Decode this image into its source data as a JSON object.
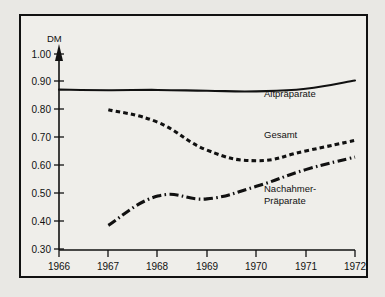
{
  "chart_data": {
    "type": "line",
    "title": "",
    "subtitle": "",
    "xlabel": "",
    "ylabel": "DM",
    "ylabel_position": "top-left-of-axis",
    "grid": false,
    "legend_position": "inline-right-labels",
    "x": [
      1966,
      1967,
      1968,
      1969,
      1970,
      1971,
      1972
    ],
    "xtick_labels": [
      "1966",
      "1967",
      "1968",
      "1969",
      "1970",
      "1971",
      "1972"
    ],
    "ytick_labels": [
      "1.00",
      "0.90",
      "0.80",
      "0.70",
      "0.60",
      "0.50",
      "0.40",
      "0.30"
    ],
    "ytick_values": [
      1.0,
      0.9,
      0.8,
      0.7,
      0.6,
      0.5,
      0.4,
      0.3
    ],
    "xlim": [
      1966,
      1972
    ],
    "ylim": [
      0.3,
      1.0
    ],
    "series": [
      {
        "name": "Altpräparate",
        "style": "solid",
        "x": [
          1966,
          1967,
          1968,
          1969,
          1970,
          1971,
          1972
        ],
        "values": [
          0.872,
          0.87,
          0.871,
          0.868,
          0.866,
          0.875,
          0.905
        ]
      },
      {
        "name": "Gesamt",
        "style": "dashed",
        "x": [
          1967,
          1968,
          1969,
          1970,
          1971,
          1972
        ],
        "values": [
          0.8,
          0.755,
          0.655,
          0.617,
          0.652,
          0.69
        ]
      },
      {
        "name": "Nachahmer-Präparate",
        "style": "dash-dot",
        "x": [
          1967,
          1968,
          1969,
          1970,
          1971,
          1972
        ],
        "values": [
          0.385,
          0.49,
          0.48,
          0.525,
          0.585,
          0.63
        ]
      }
    ],
    "annotations": [
      {
        "text": "Altpräparate",
        "x": 1970.1,
        "y": 0.845
      },
      {
        "text": "Gesamt",
        "x": 1970.1,
        "y": 0.7
      },
      {
        "text": "Nachahmer-",
        "x": 1970.1,
        "y": 0.505
      },
      {
        "text": "Präparate",
        "x": 1970.1,
        "y": 0.463
      }
    ],
    "colors": {
      "line": "#111111",
      "background": "#efeeea",
      "border": "#111111",
      "page": "#e9e8e4"
    }
  },
  "axis": {
    "y_unit_label": "DM"
  },
  "series_labels": {
    "alt": "Altpräparate",
    "gesamt": "Gesamt",
    "nachahmer_line1": "Nachahmer-",
    "nachahmer_line2": "Präparate"
  },
  "ytick": {
    "t0": "1.00",
    "t1": "0.90",
    "t2": "0.80",
    "t3": "0.70",
    "t4": "0.60",
    "t5": "0.50",
    "t6": "0.40",
    "t7": "0.30"
  },
  "xtick": {
    "t0": "1966",
    "t1": "1967",
    "t2": "1968",
    "t3": "1969",
    "t4": "1970",
    "t5": "1971",
    "t6": "1972"
  }
}
